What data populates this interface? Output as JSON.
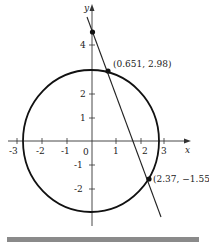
{
  "diagram": {
    "type": "circle-line-intersection",
    "axes": {
      "x_label": "x",
      "y_label": "y",
      "x_ticks": [
        "-3",
        "-2",
        "-1",
        "0",
        "1",
        "2",
        "3"
      ],
      "y_ticks": [
        "4",
        "2",
        "1",
        "-1",
        "-2"
      ]
    },
    "circle": {
      "center": [
        0,
        0
      ],
      "radius": 3
    },
    "points": [
      {
        "label": "(0.651, 2.98)",
        "x": 0.651,
        "y": 2.98
      },
      {
        "label": "(2.37, −1.55)",
        "x": 2.37,
        "y": -1.55
      },
      {
        "label": "",
        "x": 0,
        "y": 4.7
      }
    ],
    "colors": {
      "stroke": "#111111",
      "bar": "#8a8a8a"
    }
  }
}
